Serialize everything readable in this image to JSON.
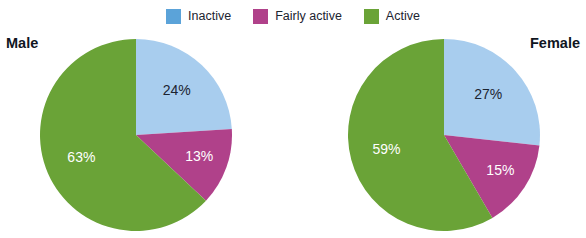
{
  "legend": {
    "position": "top-center",
    "items": [
      {
        "label": "Inactive",
        "color": "#5ba3d9",
        "swatch_name": "legend-swatch-inactive"
      },
      {
        "label": "Fairly active",
        "color": "#b0418a",
        "swatch_name": "legend-swatch-fairly-active"
      },
      {
        "label": "Active",
        "color": "#6aa337",
        "swatch_name": "legend-swatch-active"
      }
    ]
  },
  "colors": {
    "inactive_slice": "#a8cdee",
    "fairly_active_slice": "#b0418a",
    "active_slice": "#6aa337",
    "inactive_legend": "#5ba3d9",
    "fairly_active_legend": "#b0418a",
    "active_legend": "#6aa337",
    "title_text": "#10161f",
    "dark_label_text": "#1c2430",
    "light_label_text": "#ffffff",
    "background": "#ffffff"
  },
  "panels": {
    "male": {
      "title": "Male",
      "title_align": "left"
    },
    "female": {
      "title": "Female",
      "title_align": "right"
    }
  },
  "chart_data": [
    {
      "type": "pie",
      "title": "Male",
      "categories": [
        "Inactive",
        "Fairly active",
        "Active"
      ],
      "values": [
        24,
        13,
        63
      ],
      "labels": [
        "24%",
        "13%",
        "63%"
      ],
      "colors": [
        "#a8cdee",
        "#b0418a",
        "#6aa337"
      ],
      "units": "percent",
      "start_angle_deg": 0,
      "direction": "clockwise",
      "legend": "shared, top-center"
    },
    {
      "type": "pie",
      "title": "Female",
      "categories": [
        "Inactive",
        "Fairly active",
        "Active"
      ],
      "values": [
        27,
        15,
        59
      ],
      "labels": [
        "27%",
        "15%",
        "59%"
      ],
      "colors": [
        "#a8cdee",
        "#b0418a",
        "#6aa337"
      ],
      "units": "percent",
      "start_angle_deg": 0,
      "direction": "clockwise",
      "legend": "shared, top-center"
    }
  ]
}
